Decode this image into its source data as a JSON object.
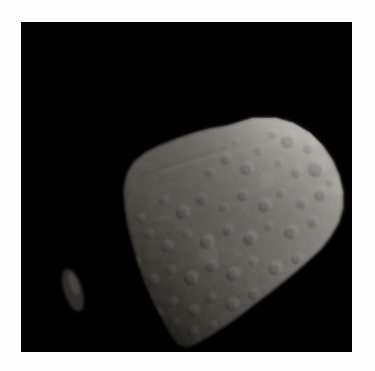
{
  "page": {
    "background_color": "#fdfdfd",
    "width": 375,
    "height": 371
  },
  "photo": {
    "frame": {
      "x": 21,
      "y": 22,
      "width": 331,
      "height": 330
    },
    "background_color": "#000000",
    "subject_name": "asteroid",
    "alt_text": "Grayscale photograph of an irregular, heavily cratered asteroid against a black sky",
    "caption": "",
    "illumination": "lit from upper right, terminator along upper-left limb"
  },
  "chart_data": {
    "type": "scatter",
    "title": "",
    "xlabel": "",
    "ylabel": "",
    "note": "Not a chart; grayscale image. Values below describe rendered shading geometry.",
    "body_outline": "M 206,104 L 232,96 L 255,96 L 272,101 L 289,111 L 302,124 L 312,139 L 318,153 L 322,170 L 322,186 L 318,200 L 310,214 L 300,227 L 288,238 L 272,252 L 252,268 L 231,284 L 210,300 L 193,311 L 178,320 L 166,325 L 157,322 L 150,313 L 143,300 L 134,283 L 126,265 L 118,244 L 112,223 L 107,203 L 104,184 L 103,167 L 106,152 L 113,140 L 124,131 L 138,124 L 153,118 L 170,112 L 188,107 Z",
    "terminator_path": "M 206,104 L 188,107 L 170,112 L 153,118 L 138,124 L 124,131 L 113,140 L 106,152 L 103,167",
    "brightness_range": [
      18,
      208
    ],
    "craters": [
      {
        "cx": 268,
        "cy": 118,
        "r": 7,
        "depth": 0.55
      },
      {
        "cx": 288,
        "cy": 126,
        "r": 5,
        "depth": 0.5
      },
      {
        "cx": 252,
        "cy": 112,
        "r": 4,
        "depth": 0.45
      },
      {
        "cx": 296,
        "cy": 146,
        "r": 8,
        "depth": 0.5
      },
      {
        "cx": 276,
        "cy": 150,
        "r": 5,
        "depth": 0.45
      },
      {
        "cx": 258,
        "cy": 140,
        "r": 4,
        "depth": 0.4
      },
      {
        "cx": 238,
        "cy": 128,
        "r": 4,
        "depth": 0.4
      },
      {
        "cx": 226,
        "cy": 146,
        "r": 6,
        "depth": 0.5
      },
      {
        "cx": 205,
        "cy": 137,
        "r": 5,
        "depth": 0.45
      },
      {
        "cx": 189,
        "cy": 150,
        "r": 4,
        "depth": 0.4
      },
      {
        "cx": 300,
        "cy": 172,
        "r": 6,
        "depth": 0.45
      },
      {
        "cx": 281,
        "cy": 181,
        "r": 5,
        "depth": 0.45
      },
      {
        "cx": 260,
        "cy": 171,
        "r": 4,
        "depth": 0.4
      },
      {
        "cx": 244,
        "cy": 183,
        "r": 6,
        "depth": 0.5
      },
      {
        "cx": 222,
        "cy": 173,
        "r": 5,
        "depth": 0.45
      },
      {
        "cx": 203,
        "cy": 185,
        "r": 4,
        "depth": 0.4
      },
      {
        "cx": 181,
        "cy": 177,
        "r": 5,
        "depth": 0.45
      },
      {
        "cx": 162,
        "cy": 190,
        "r": 6,
        "depth": 0.5
      },
      {
        "cx": 143,
        "cy": 178,
        "r": 4,
        "depth": 0.4
      },
      {
        "cx": 292,
        "cy": 200,
        "r": 5,
        "depth": 0.4
      },
      {
        "cx": 270,
        "cy": 210,
        "r": 6,
        "depth": 0.45
      },
      {
        "cx": 248,
        "cy": 204,
        "r": 4,
        "depth": 0.4
      },
      {
        "cx": 229,
        "cy": 216,
        "r": 6,
        "depth": 0.5
      },
      {
        "cx": 207,
        "cy": 208,
        "r": 5,
        "depth": 0.45
      },
      {
        "cx": 186,
        "cy": 220,
        "r": 6,
        "depth": 0.5
      },
      {
        "cx": 166,
        "cy": 212,
        "r": 4,
        "depth": 0.4
      },
      {
        "cx": 146,
        "cy": 224,
        "r": 5,
        "depth": 0.45
      },
      {
        "cx": 128,
        "cy": 212,
        "r": 4,
        "depth": 0.4
      },
      {
        "cx": 276,
        "cy": 236,
        "r": 5,
        "depth": 0.4
      },
      {
        "cx": 254,
        "cy": 246,
        "r": 6,
        "depth": 0.45
      },
      {
        "cx": 232,
        "cy": 240,
        "r": 4,
        "depth": 0.4
      },
      {
        "cx": 212,
        "cy": 252,
        "r": 6,
        "depth": 0.5
      },
      {
        "cx": 191,
        "cy": 244,
        "r": 5,
        "depth": 0.45
      },
      {
        "cx": 170,
        "cy": 256,
        "r": 6,
        "depth": 0.5
      },
      {
        "cx": 150,
        "cy": 248,
        "r": 4,
        "depth": 0.4
      },
      {
        "cx": 132,
        "cy": 258,
        "r": 5,
        "depth": 0.45
      },
      {
        "cx": 233,
        "cy": 272,
        "r": 5,
        "depth": 0.4
      },
      {
        "cx": 211,
        "cy": 282,
        "r": 6,
        "depth": 0.45
      },
      {
        "cx": 190,
        "cy": 276,
        "r": 4,
        "depth": 0.4
      },
      {
        "cx": 172,
        "cy": 288,
        "r": 5,
        "depth": 0.45
      },
      {
        "cx": 152,
        "cy": 280,
        "r": 4,
        "depth": 0.4
      },
      {
        "cx": 136,
        "cy": 292,
        "r": 5,
        "depth": 0.45
      },
      {
        "cx": 192,
        "cy": 303,
        "r": 4,
        "depth": 0.4
      },
      {
        "cx": 172,
        "cy": 309,
        "r": 4,
        "depth": 0.4
      },
      {
        "cx": 215,
        "cy": 120,
        "r": 3,
        "depth": 0.35
      },
      {
        "cx": 310,
        "cy": 160,
        "r": 4,
        "depth": 0.35
      },
      {
        "cx": 120,
        "cy": 196,
        "r": 4,
        "depth": 0.4
      },
      {
        "cx": 115,
        "cy": 240,
        "r": 4,
        "depth": 0.4
      },
      {
        "cx": 126,
        "cy": 276,
        "r": 4,
        "depth": 0.4
      },
      {
        "cx": 155,
        "cy": 300,
        "r": 3,
        "depth": 0.35
      }
    ],
    "bright_spots": [
      {
        "cx": 300,
        "cy": 112,
        "r": 12,
        "alpha": 0.35
      },
      {
        "cx": 282,
        "cy": 100,
        "r": 9,
        "alpha": 0.3
      },
      {
        "cx": 318,
        "cy": 164,
        "r": 10,
        "alpha": 0.22
      },
      {
        "cx": 246,
        "cy": 158,
        "r": 9,
        "alpha": 0.16
      },
      {
        "cx": 188,
        "cy": 232,
        "r": 10,
        "alpha": 0.12
      }
    ],
    "detached_fragment": {
      "cx": 52,
      "cy": 268,
      "rx": 9,
      "ry": 22,
      "rotation": -18,
      "brightness": 0.22
    }
  }
}
